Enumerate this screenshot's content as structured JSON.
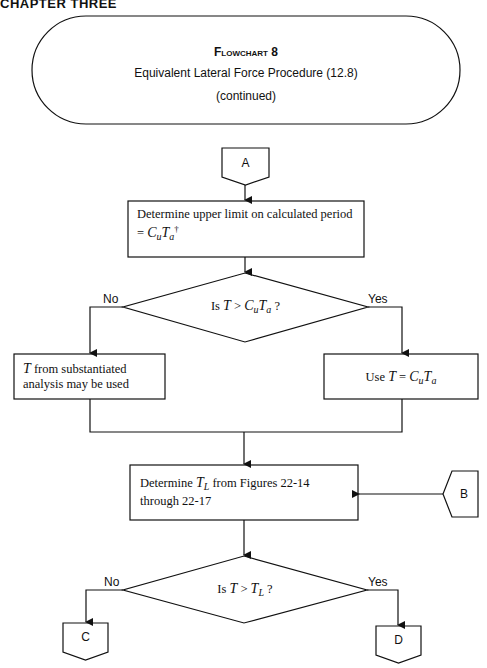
{
  "page": {
    "running_header": "CHAPTER THREE"
  },
  "title_block": {
    "line1": "Flowchart 8",
    "line2": "Equivalent Lateral Force Procedure (12.8)",
    "line3": "(continued)"
  },
  "connectors": {
    "a": "A",
    "b": "B",
    "c": "C",
    "d": "D"
  },
  "steps": {
    "upper_limit": {
      "line1": "Determine upper limit on calculated period",
      "eq_prefix": "= ",
      "c": "C",
      "u": "u",
      "t": "T",
      "a": "a",
      "dagger": "†"
    },
    "decision1": {
      "prefix": "Is ",
      "t": "T",
      "op": " > ",
      "c": "C",
      "u": "u",
      "t2": "T",
      "a": "a",
      "suffix": " ?",
      "no_label": "No",
      "yes_label": "Yes"
    },
    "no_box": {
      "t": "T",
      "line1_rest": " from substantiated",
      "line2": "analysis may be used"
    },
    "yes_box": {
      "prefix": "Use ",
      "t": "T",
      "eq": " = ",
      "c": "C",
      "u": "u",
      "t2": "T",
      "a": "a"
    },
    "determine_tl": {
      "prefix": "Determine ",
      "t": "T",
      "l": "L",
      "rest": "  from Figures 22-14",
      "line2": "through 22-17"
    },
    "decision2": {
      "prefix": "Is ",
      "t": "T",
      "op": " > ",
      "t2": "T",
      "l": "L",
      "suffix": " ?",
      "no_label": "No",
      "yes_label": "Yes"
    }
  },
  "colors": {
    "stroke": "#111111",
    "background": "#ffffff"
  }
}
